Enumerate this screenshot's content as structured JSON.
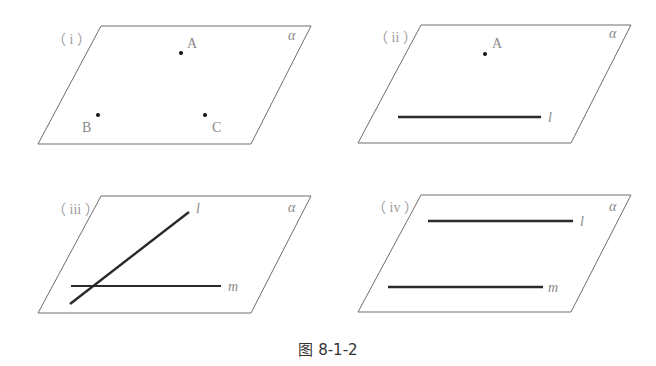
{
  "caption": "图 8-1-2",
  "plane_label": "α",
  "panels": [
    {
      "id": "i",
      "label": "（ i ）",
      "points": [
        {
          "name": "A"
        },
        {
          "name": "B"
        },
        {
          "name": "C"
        }
      ],
      "lines": []
    },
    {
      "id": "ii",
      "label": "（ ii ）",
      "points": [
        {
          "name": "A"
        }
      ],
      "lines": [
        {
          "name": "l"
        }
      ]
    },
    {
      "id": "iii",
      "label": "（ iii ）",
      "points": [],
      "lines": [
        {
          "name": "l"
        },
        {
          "name": "m"
        }
      ]
    },
    {
      "id": "iv",
      "label": "（ iv ）",
      "points": [],
      "lines": [
        {
          "name": "l"
        },
        {
          "name": "m"
        }
      ]
    }
  ]
}
